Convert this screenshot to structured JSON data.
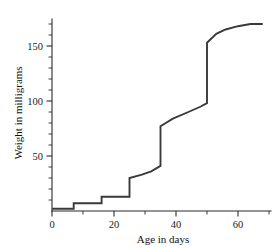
{
  "chart_data": {
    "type": "line",
    "title": "",
    "xlabel": "Age in days",
    "ylabel": "Weight in milligrams",
    "xlim": [
      0,
      70
    ],
    "ylim": [
      0,
      180
    ],
    "grid": false,
    "legend": "none",
    "x_ticks_major": [
      0,
      20,
      40,
      60
    ],
    "x_tick_labels": [
      "0",
      "20",
      "40",
      "60"
    ],
    "x_ticks_minor": [
      10,
      30,
      50,
      70
    ],
    "y_ticks_major": [
      50,
      100,
      150
    ],
    "y_tick_labels": [
      "50",
      "100",
      "150"
    ],
    "y_ticks_minor": [
      10,
      20,
      30,
      40,
      60,
      70,
      80,
      90,
      110,
      120,
      130,
      140,
      160,
      170
    ],
    "series": [
      {
        "name": "larval weight",
        "description": "stepwise growth curve with molt jumps, plateauing near 170 mg",
        "x": [
          0,
          7,
          7,
          16,
          16,
          25,
          25,
          29,
          32,
          35,
          35,
          39,
          44,
          48,
          50,
          50,
          53,
          56,
          60,
          64,
          68
        ],
        "y": [
          2,
          2,
          7,
          7,
          13,
          13,
          30,
          33,
          36,
          41,
          77,
          84,
          90,
          95,
          98,
          153,
          161,
          165,
          168,
          170,
          170
        ]
      }
    ],
    "annotations": [],
    "line_color": "#3a3a3a",
    "axis_color": "#2b2b2b",
    "background_color": "#ffffff"
  },
  "axes": {
    "x_title": "Age in days",
    "y_title": "Weight in milligrams"
  }
}
